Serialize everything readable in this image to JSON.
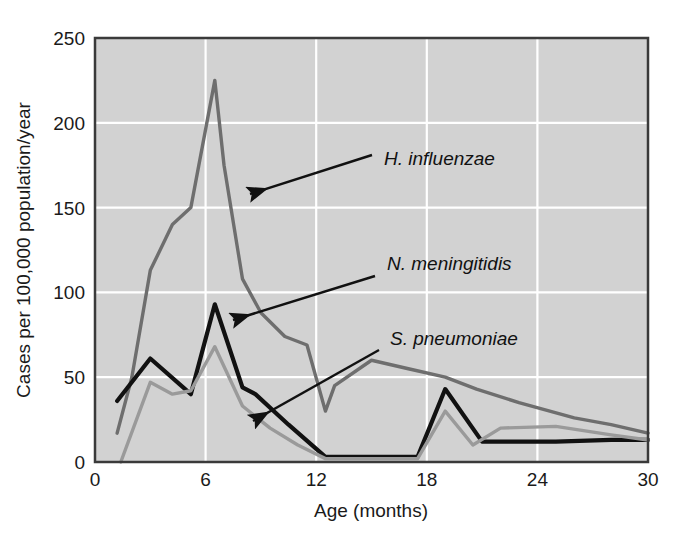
{
  "chart_data": {
    "type": "line",
    "title": "",
    "subtitle": "",
    "xlabel": "Age (months)",
    "ylabel": "Cases per 100,000 population/year",
    "xlim": [
      0,
      30
    ],
    "ylim": [
      0,
      250
    ],
    "xticks": [
      "0",
      "6",
      "12",
      "18",
      "24",
      "30"
    ],
    "xtick_values": [
      0,
      6,
      12,
      18,
      24,
      30
    ],
    "yticks": [
      "0",
      "50",
      "100",
      "150",
      "200",
      "250"
    ],
    "ytick_values": [
      0,
      50,
      100,
      150,
      200,
      250
    ],
    "grid": true,
    "grid_color": "#ffffff",
    "plot_background": "#d2d2d2",
    "legend_position": "inline-annotations",
    "series": [
      {
        "name": "H. influenzae",
        "color": "#6e6e6e",
        "x": [
          1.2,
          2.0,
          3.0,
          4.2,
          5.2,
          6.5,
          7.0,
          8.0,
          9.0,
          10.3,
          11.5,
          12.5,
          13.0,
          15.0,
          17.0,
          19.0,
          20.7,
          23.0,
          26.0,
          28.0,
          30.0
        ],
        "y": [
          17,
          50,
          113,
          140,
          150,
          225,
          175,
          108,
          88,
          74,
          69,
          30,
          45,
          60,
          55,
          50,
          43,
          35,
          26,
          22,
          17
        ]
      },
      {
        "name": "N. meningitidis",
        "color": "#111111",
        "x": [
          1.2,
          3.0,
          5.2,
          6.5,
          8.0,
          8.7,
          10.5,
          12.5,
          17.5,
          19.0,
          21.0,
          25.0,
          28.0,
          30.0
        ],
        "y": [
          36,
          61,
          40,
          93,
          44,
          40,
          22,
          3,
          3,
          43,
          12,
          12,
          13,
          13
        ]
      },
      {
        "name": "S. pneumoniae",
        "color": "#9a9a9a",
        "x": [
          1.4,
          3.0,
          4.2,
          5.2,
          6.5,
          8.0,
          9.5,
          11.0,
          12.5,
          17.5,
          19.0,
          20.5,
          22.0,
          25.0,
          28.0,
          30.0
        ],
        "y": [
          0,
          47,
          40,
          42,
          68,
          33,
          20,
          10,
          2,
          2,
          30,
          10,
          20,
          21,
          16,
          13
        ]
      }
    ],
    "annotations": [
      {
        "label": "H. influenzae",
        "text_x": 384,
        "text_y": 165,
        "arrow_from_x": 372,
        "arrow_from_y": 155,
        "arrow_to_x": 250,
        "arrow_to_y": 194
      },
      {
        "label": "N. meningitidis",
        "text_x": 387,
        "text_y": 270,
        "arrow_from_x": 375,
        "arrow_from_y": 276,
        "arrow_to_x": 233,
        "arrow_to_y": 320
      },
      {
        "label": "S. pneumoniae",
        "text_x": 390,
        "text_y": 345,
        "arrow_from_x": 379,
        "arrow_from_y": 350,
        "arrow_to_x": 253,
        "arrow_to_y": 421
      }
    ]
  },
  "figure": {
    "plot_left": 95,
    "plot_top": 38,
    "plot_right": 648,
    "plot_bottom": 462
  }
}
